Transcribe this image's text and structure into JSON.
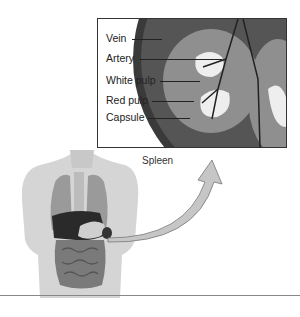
{
  "diagram": {
    "title": "Spleen",
    "labels": [
      {
        "text": "Vein"
      },
      {
        "text": "Artery"
      },
      {
        "text": "White pulp"
      },
      {
        "text": "Red pulp"
      },
      {
        "text": "Capsule"
      }
    ],
    "caption": "Spleen"
  }
}
